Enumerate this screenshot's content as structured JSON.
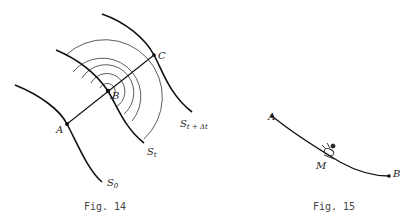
{
  "figures": [
    {
      "id": "fig14",
      "caption": "Fig. 14",
      "points": {
        "A": "A",
        "B": "B",
        "C": "C"
      },
      "curves": {
        "s0": {
          "main": "S",
          "sub": "0"
        },
        "st": {
          "main": "S",
          "sub": "t"
        },
        "stdt": {
          "main": "S",
          "sub": "t + Δt"
        }
      }
    },
    {
      "id": "fig15",
      "caption": "Fig. 15",
      "points": {
        "A": "A",
        "B": "B",
        "M": "M"
      }
    }
  ],
  "colors": {
    "stroke": "#111111",
    "thin": "#333333",
    "text": "#222222"
  }
}
